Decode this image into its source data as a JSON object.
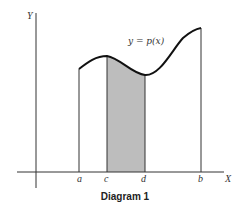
{
  "diagram": {
    "caption": "Diagram 1",
    "axes": {
      "x_label": "X",
      "y_label": "Y"
    },
    "curve_label": "y = p(x)",
    "points": [
      {
        "name": "a",
        "label": "a"
      },
      {
        "name": "c",
        "label": "c"
      },
      {
        "name": "d",
        "label": "d"
      },
      {
        "name": "b",
        "label": "b"
      }
    ],
    "shaded_region": {
      "from": "c",
      "to": "d",
      "color": "#bdbdbd"
    },
    "colors": {
      "curve": "#111111",
      "axis": "#333333",
      "shade": "#bdbdbd"
    }
  }
}
